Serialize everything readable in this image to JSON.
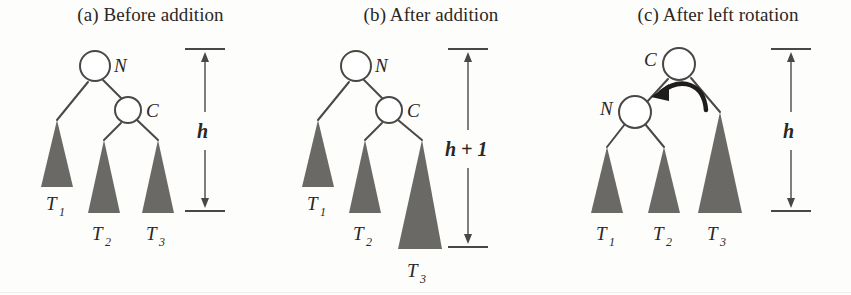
{
  "figure": {
    "title_visible": false,
    "background_color": "#fdfdfc",
    "ink_color": "#4a4845",
    "subtree_fill_color": "#6b6966",
    "node_fill_color": "#ffffff",
    "node_stroke_color": "#4a4845"
  },
  "panels": [
    {
      "id": "a",
      "caption": "(a) Before addition",
      "nodes": [
        {
          "name": "N",
          "label": "N",
          "role": "unbalanced-root"
        },
        {
          "name": "C",
          "label": "C",
          "role": "right-child"
        }
      ],
      "subtrees": [
        {
          "label": "T",
          "subscript": "1",
          "height_rank": "tall"
        },
        {
          "label": "T",
          "subscript": "2",
          "height_rank": "short"
        },
        {
          "label": "T",
          "subscript": "3",
          "height_rank": "short"
        }
      ],
      "height_measure": {
        "label": "h",
        "label_parts": [
          "h"
        ]
      }
    },
    {
      "id": "b",
      "caption": "(b) After addition",
      "nodes": [
        {
          "name": "N",
          "label": "N",
          "role": "unbalanced-root"
        },
        {
          "name": "C",
          "label": "C",
          "role": "right-child"
        }
      ],
      "subtrees": [
        {
          "label": "T",
          "subscript": "1",
          "height_rank": "tall"
        },
        {
          "label": "T",
          "subscript": "2",
          "height_rank": "short"
        },
        {
          "label": "T",
          "subscript": "3",
          "height_rank": "tallest"
        }
      ],
      "height_measure": {
        "label": "h + 1",
        "label_parts": [
          "h",
          "+",
          "1"
        ]
      }
    },
    {
      "id": "c",
      "caption": "(c) After left rotation",
      "nodes": [
        {
          "name": "C",
          "label": "C",
          "role": "new-root"
        },
        {
          "name": "N",
          "label": "N",
          "role": "left-child"
        }
      ],
      "subtrees": [
        {
          "label": "T",
          "subscript": "1",
          "height_rank": "tall"
        },
        {
          "label": "T",
          "subscript": "2",
          "height_rank": "tall"
        },
        {
          "label": "T",
          "subscript": "3",
          "height_rank": "tallest"
        }
      ],
      "height_measure": {
        "label": "h",
        "label_parts": [
          "h"
        ]
      },
      "annotation": {
        "name": "rotation-arrow",
        "direction": "left",
        "style": "curved"
      }
    }
  ]
}
